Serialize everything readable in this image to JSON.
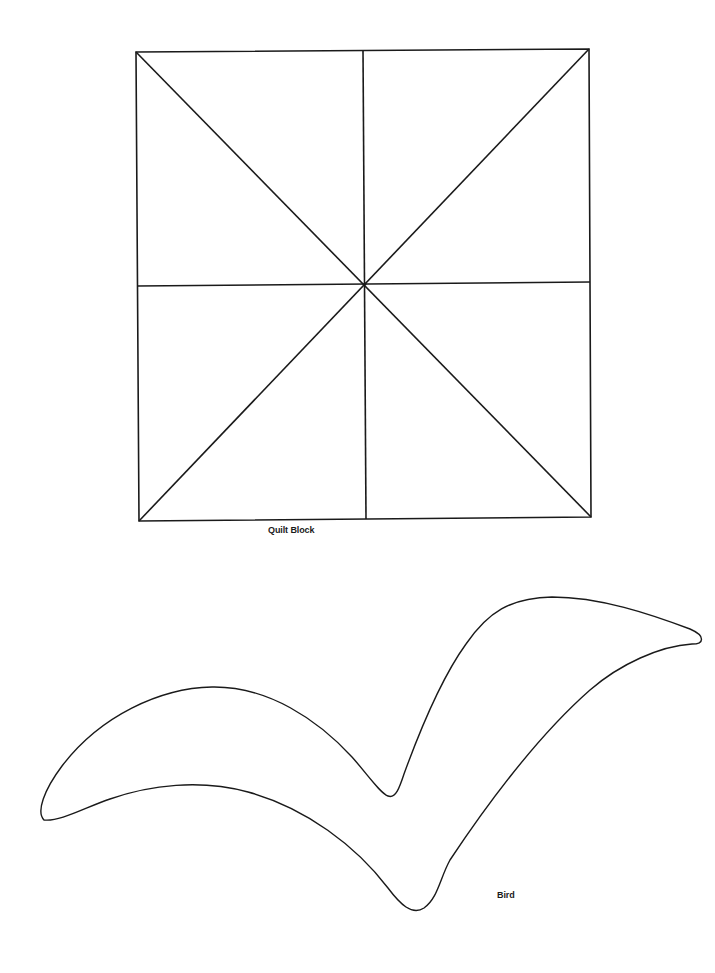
{
  "page": {
    "background": "#ffffff",
    "stroke_color": "#1a1a1a"
  },
  "figures": [
    {
      "id": "quilt-block",
      "label": "Quilt Block",
      "shape": "square divided by vertical, horizontal and two diagonal lines into 8 triangles",
      "corners": {
        "top_left": [
          136,
          52
        ],
        "top_right": [
          589,
          49
        ],
        "bottom_right": [
          591,
          517
        ],
        "bottom_left": [
          139,
          521
        ]
      },
      "center": [
        365,
        284
      ]
    },
    {
      "id": "bird",
      "label": "Bird",
      "shape": "outline of a bird in flight (closed curved silhouette)",
      "key_points": {
        "left_wing_tip": [
          41,
          819
        ],
        "left_wing_top": [
          220,
          687
        ],
        "wing_notch": [
          392,
          796
        ],
        "right_wing_top": [
          560,
          597
        ],
        "right_wing_tip": [
          702,
          637
        ],
        "body_bottom": [
          413,
          911
        ],
        "underside_peak": [
          175,
          787
        ]
      }
    }
  ]
}
